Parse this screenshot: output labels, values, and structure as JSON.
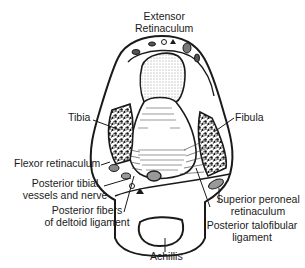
{
  "diagram": {
    "type": "anatomical cross-section",
    "colors": {
      "ink": "#1a1a1a",
      "background": "#ffffff"
    },
    "labels": {
      "extensor_line1": "Extensor",
      "extensor_line2": "Retinaculum",
      "tibia": "Tibia",
      "fibula": "Fibula",
      "flexor": "Flexor retinaculum",
      "ptv_line1": "Posterior tibial",
      "ptv_line2": "vessels and nerve",
      "pfd_line1": "Posterior fibers",
      "pfd_line2": "of deltoid ligament",
      "spr_line1": "Superior peroneal",
      "spr_line2": "retinaculum",
      "ptf_line1": "Posterior talofibular",
      "ptf_line2": "ligament",
      "achillis": "Achillis"
    }
  }
}
